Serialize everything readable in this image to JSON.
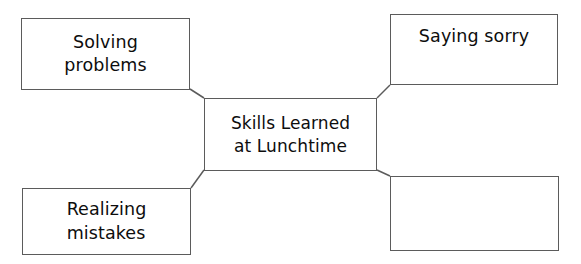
{
  "diagram": {
    "type": "graphic-organizer",
    "layout": "center-with-four-branches",
    "background_color": "#ffffff",
    "border_color": "#5b5b5b",
    "text_color": "#0d0d0d",
    "center": {
      "id": "center",
      "label": "Skills Learned\nat Lunchtime",
      "empty": false
    },
    "branches": [
      {
        "id": "top-left",
        "position": "top-left",
        "label": "Solving\nproblems",
        "empty": false
      },
      {
        "id": "top-right",
        "position": "top-right",
        "label": "Saying sorry",
        "empty": false
      },
      {
        "id": "bottom-left",
        "position": "bottom-left",
        "label": "Realizing\nmistakes",
        "empty": false
      },
      {
        "id": "bottom-right",
        "position": "bottom-right",
        "label": "",
        "empty": true
      }
    ],
    "connectors": [
      {
        "id": "connector-top-left",
        "from": "center",
        "to": "top-left"
      },
      {
        "id": "connector-top-right",
        "from": "center",
        "to": "top-right"
      },
      {
        "id": "connector-bottom-left",
        "from": "center",
        "to": "bottom-left"
      },
      {
        "id": "connector-bottom-right",
        "from": "center",
        "to": "bottom-right"
      }
    ]
  }
}
